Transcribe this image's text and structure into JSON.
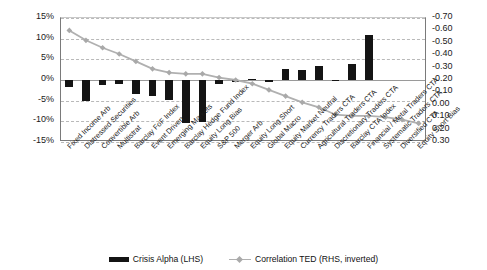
{
  "chart_data": {
    "type": "bar",
    "title": "",
    "subtitle": "",
    "xlabel": "",
    "ylabel": "",
    "y2label": "",
    "grid": true,
    "legend_position": "bottom",
    "categories": [
      "Fixed Income Arb",
      "Distressed Securities",
      "Convertible Arb",
      "Multistrat",
      "Barclay FoF Index",
      "Event Driven",
      "Emerging Markets",
      "Barclay Hedge Fund Index",
      "Equity Long Bias",
      "S&P 500",
      "Merger Arb",
      "Equity Long Short",
      "Global Macro",
      "Equity Market Neutral",
      "Currency Traders CTA",
      "Agricultural Traders CTA",
      "Discretionary Traders CTA",
      "Barclay CTA Index",
      "Financial / Metal Traders CTA",
      "Systematic Traders CTA",
      "Diversified CTA",
      "Equity Short Bias"
    ],
    "series": [
      {
        "name": "Crisis Alpha (LHS)",
        "type": "bar",
        "axis": "left",
        "color": "#141414",
        "values": [
          -1.8,
          -5.2,
          -1.3,
          -0.9,
          -3.4,
          -3.9,
          -4.9,
          -10.5,
          -10.2,
          -1.0,
          -0.4,
          0.3,
          -0.2,
          2.6,
          2.4,
          3.3,
          0.1,
          3.8,
          11.0,
          0,
          0,
          0
        ]
      },
      {
        "name": "Correlation TED (RHS, inverted)",
        "type": "line",
        "axis": "right",
        "color": "#b0b0b0",
        "values": [
          -0.6,
          -0.52,
          -0.46,
          -0.41,
          -0.35,
          -0.29,
          -0.26,
          -0.25,
          -0.25,
          -0.22,
          -0.2,
          -0.17,
          -0.12,
          -0.07,
          -0.02,
          0.02,
          0.08,
          0.09,
          0.09,
          0.1,
          0.12,
          0.15
        ]
      }
    ],
    "yaxis_left": {
      "ticks": [
        "15%",
        "10%",
        "5%",
        "0%",
        "-5%",
        "-10%",
        "-15%"
      ],
      "values": [
        15,
        10,
        5,
        0,
        -5,
        -10,
        -15
      ],
      "min": -15,
      "max": 15
    },
    "yaxis_right": {
      "ticks": [
        "-0.70",
        "-0.60",
        "-0.50",
        "-0.40",
        "-0.30",
        "-0.20",
        "-0.10",
        "0.00",
        "0.10",
        "0.20",
        "0.30"
      ],
      "values": [
        -0.7,
        -0.6,
        -0.5,
        -0.4,
        -0.3,
        -0.2,
        -0.1,
        0.0,
        0.1,
        0.2,
        0.3
      ],
      "min": -0.7,
      "max": 0.3,
      "inverted": true
    }
  },
  "legend": {
    "items": [
      {
        "label": "Crisis Alpha (LHS)",
        "marker": "bar-swatch",
        "color": "#141414"
      },
      {
        "label": "Correlation TED (RHS, inverted)",
        "marker": "line-swatch",
        "color": "#b0b0b0"
      }
    ]
  },
  "colors": {
    "bar": "#141414",
    "line": "#b0b0b0",
    "grid": "#b9b9b9",
    "axis": "#7a7a7a",
    "background": "#ffffff",
    "text": "#1a1a1a"
  }
}
